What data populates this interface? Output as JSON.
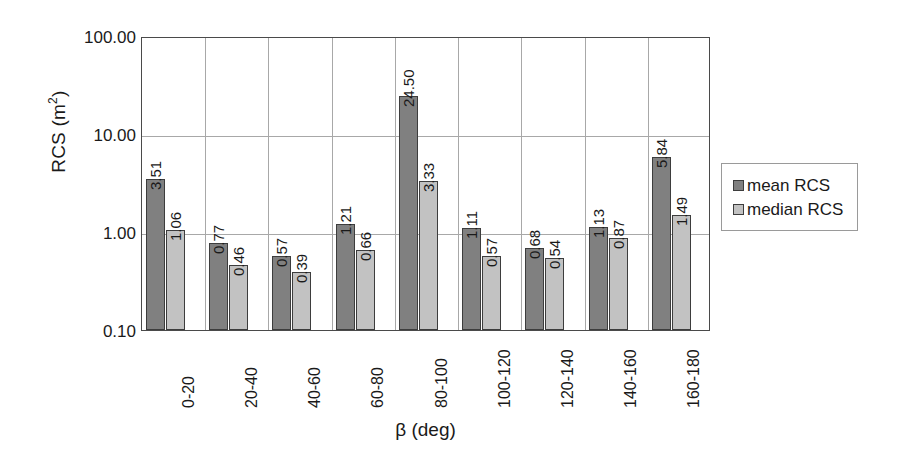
{
  "chart_data": {
    "type": "bar",
    "title": "",
    "xlabel": "β (deg)",
    "ylabel": "RCS (m²)",
    "ylabel_base": "RCS (m",
    "ylabel_sup": "2",
    "ylabel_tail": ")",
    "yscale": "log",
    "ylim": [
      0.1,
      100.0
    ],
    "grid": true,
    "legend_position": "right",
    "y_ticks": [
      "100.00",
      "10.00",
      "1.00",
      "0.10"
    ],
    "y_tick_values": [
      100.0,
      10.0,
      1.0,
      0.1
    ],
    "categories": [
      "0-20",
      "20-40",
      "40-60",
      "60-80",
      "80-100",
      "100-120",
      "120-140",
      "140-160",
      "160-180"
    ],
    "series": [
      {
        "name": "mean RCS",
        "color": "#808080",
        "values": [
          3.51,
          0.77,
          0.57,
          1.21,
          24.5,
          1.11,
          0.68,
          1.13,
          5.84
        ],
        "labels": [
          "3.51",
          "0.77",
          "0.57",
          "1.21",
          "24.50",
          "1.11",
          "0.68",
          "1.13",
          "5.84"
        ]
      },
      {
        "name": "median RCS",
        "color": "#c2c2c2",
        "values": [
          1.06,
          0.46,
          0.39,
          0.66,
          3.33,
          0.57,
          0.54,
          0.87,
          1.49
        ],
        "labels": [
          "1.06",
          "0.46",
          "0.39",
          "0.66",
          "3.33",
          "0.57",
          "0.54",
          "0.87",
          "1.49"
        ]
      }
    ]
  },
  "legend": {
    "items": [
      {
        "label": "mean RCS",
        "color": "#808080"
      },
      {
        "label": "median RCS",
        "color": "#c2c2c2"
      }
    ]
  }
}
